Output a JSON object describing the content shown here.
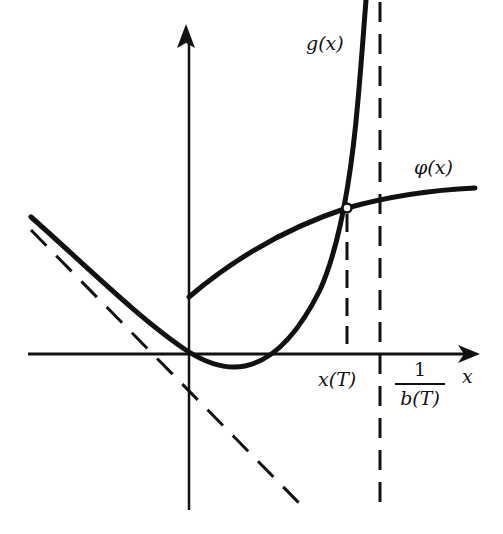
{
  "figure": {
    "colors": {
      "ink": "#111111",
      "background": "#ffffff"
    }
  },
  "axes": {
    "x_label": "x",
    "y_label": ""
  },
  "curves": [
    {
      "id": "g",
      "label": "g(x)",
      "style": "solid-thick",
      "description": "convex curve with slant asymptote on left, minimum just right of origin, blows up at 1/b(T)"
    },
    {
      "id": "phi",
      "label": "φ(x)",
      "style": "solid-thick",
      "description": "increasing concave curve starting at positive y-intercept"
    },
    {
      "id": "slant_asymptote",
      "label": "",
      "style": "dashed",
      "description": "slant asymptote of g for x → -∞"
    },
    {
      "id": "vertical_asymptote",
      "label": "",
      "style": "dashed",
      "description": "vertical asymptote at x = 1/b(T)"
    },
    {
      "id": "xT_marker",
      "label": "",
      "style": "dashed",
      "description": "vertical drop line from intersection to x-axis"
    }
  ],
  "labels": {
    "g": "g(x)",
    "phi": "φ(x)",
    "xT": "x(T)",
    "asymptote_numerator": "1",
    "asymptote_denominator": "b(T)",
    "x_axis": "x"
  },
  "points": {
    "intersection": {
      "label": "x(T)",
      "marker": "open-circle"
    }
  }
}
